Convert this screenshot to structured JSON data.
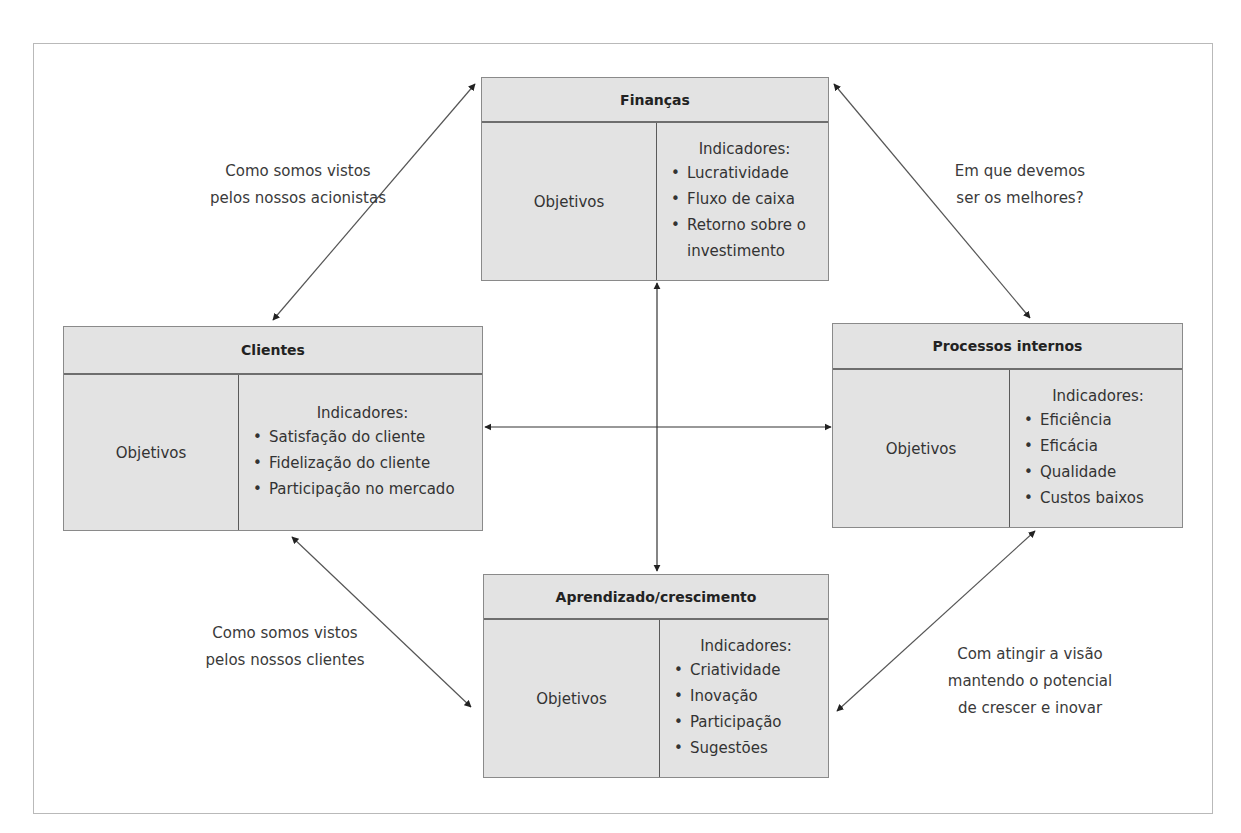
{
  "diagram": {
    "colors": {
      "box_fill": "#e3e3e3",
      "box_border": "#8a8a8a",
      "arrow": "#555555",
      "arrowhead": "#222222",
      "frame": "#b9b9b9"
    },
    "perspectives": {
      "financas": {
        "title": "Finanças",
        "objectives_label": "Objetivos",
        "indicators_label": "Indicadores:",
        "indicators": [
          "Lucratividade",
          "Fluxo de caixa",
          "Retorno sobre o investimento"
        ]
      },
      "clientes": {
        "title": "Clientes",
        "objectives_label": "Objetivos",
        "indicators_label": "Indicadores:",
        "indicators": [
          "Satisfação do cliente",
          "Fidelização do cliente",
          "Participação no mercado"
        ]
      },
      "processos": {
        "title": "Processos internos",
        "objectives_label": "Objetivos",
        "indicators_label": "Indicadores:",
        "indicators": [
          "Eficiência",
          "Eficácia",
          "Qualidade",
          "Custos baixos"
        ]
      },
      "aprendizado": {
        "title": "Aprendizado/crescimento",
        "objectives_label": "Objetivos",
        "indicators_label": "Indicadores:",
        "indicators": [
          "Criatividade",
          "Inovação",
          "Participação",
          "Sugestões"
        ]
      }
    },
    "notes": {
      "top_left": [
        "Como somos vistos",
        "pelos nossos acionistas"
      ],
      "top_right": [
        "Em que devemos",
        "ser os melhores?"
      ],
      "bottom_left": [
        "Como somos vistos",
        "pelos nossos clientes"
      ],
      "bottom_right": [
        "Com atingir a visão",
        "mantendo o potencial",
        "de crescer e inovar"
      ]
    },
    "connections": [
      {
        "from": "financas",
        "to": "clientes",
        "type": "bidirectional"
      },
      {
        "from": "financas",
        "to": "processos",
        "type": "bidirectional"
      },
      {
        "from": "clientes",
        "to": "aprendizado",
        "type": "bidirectional"
      },
      {
        "from": "processos",
        "to": "aprendizado",
        "type": "bidirectional"
      },
      {
        "from": "clientes",
        "to": "processos",
        "type": "bidirectional"
      },
      {
        "from": "financas",
        "to": "aprendizado",
        "type": "bidirectional"
      }
    ]
  }
}
